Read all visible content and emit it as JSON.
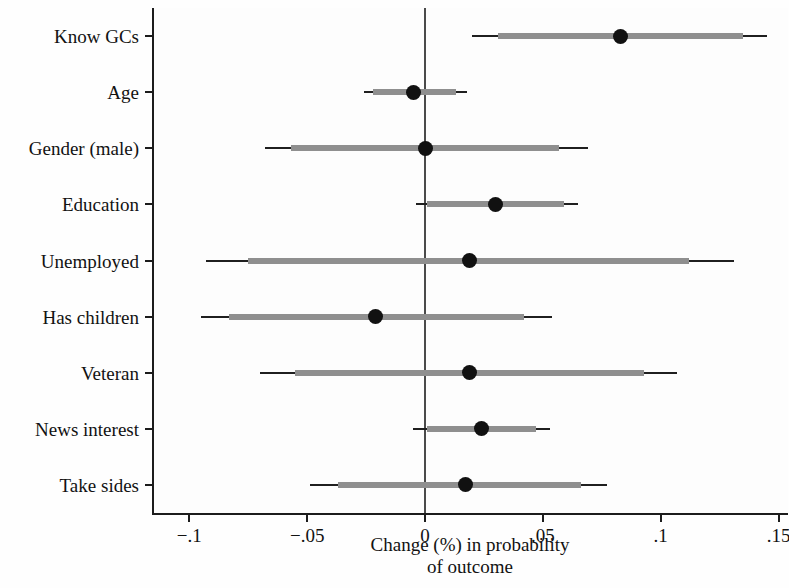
{
  "chart_data": {
    "type": "bar",
    "subtype": "coefficient-plot-horizontal",
    "title": "",
    "xlabel": "Change (%) in probability of outcome",
    "xlabel_lines": [
      "Change (%) in probability",
      "of outcome"
    ],
    "ylabel": "",
    "xlim": [
      -0.115,
      0.154
    ],
    "xticks": [
      -0.1,
      -0.05,
      0,
      0.05,
      0.1,
      0.15
    ],
    "xticklabels": [
      "−.1",
      "−.05",
      "0",
      ".05",
      ".1",
      ".15"
    ],
    "grid": false,
    "legend": null,
    "reference_line": 0,
    "categories": [
      "Know GCs",
      "Age",
      "Gender (male)",
      "Education",
      "Unemployed",
      "Has children",
      "Veteran",
      "News interest",
      "Take sides"
    ],
    "values": [
      0.083,
      -0.005,
      0.0,
      0.03,
      0.019,
      -0.021,
      0.019,
      0.024,
      0.017
    ],
    "series": [
      {
        "name": "Point estimate with 90% and 95% confidence intervals",
        "points": [
          {
            "category": "Know GCs",
            "estimate": 0.083,
            "ci_outer": [
              0.02,
              0.145
            ],
            "ci_inner": [
              0.031,
              0.135
            ]
          },
          {
            "category": "Age",
            "estimate": -0.005,
            "ci_outer": [
              -0.026,
              0.018
            ],
            "ci_inner": [
              -0.022,
              0.013
            ]
          },
          {
            "category": "Gender (male)",
            "estimate": 0.0,
            "ci_outer": [
              -0.068,
              0.069
            ],
            "ci_inner": [
              -0.057,
              0.057
            ]
          },
          {
            "category": "Education",
            "estimate": 0.03,
            "ci_outer": [
              -0.004,
              0.065
            ],
            "ci_inner": [
              0.001,
              0.059
            ]
          },
          {
            "category": "Unemployed",
            "estimate": 0.019,
            "ci_outer": [
              -0.093,
              0.131
            ],
            "ci_inner": [
              -0.075,
              0.112
            ]
          },
          {
            "category": "Has children",
            "estimate": -0.021,
            "ci_outer": [
              -0.095,
              0.054
            ],
            "ci_inner": [
              -0.083,
              0.042
            ]
          },
          {
            "category": "Veteran",
            "estimate": 0.019,
            "ci_outer": [
              -0.07,
              0.107
            ],
            "ci_inner": [
              -0.055,
              0.093
            ]
          },
          {
            "category": "News interest",
            "estimate": 0.024,
            "ci_outer": [
              -0.005,
              0.053
            ],
            "ci_inner": [
              0.001,
              0.047
            ]
          },
          {
            "category": "Take sides",
            "estimate": 0.017,
            "ci_outer": [
              -0.049,
              0.077
            ],
            "ci_inner": [
              -0.037,
              0.066
            ]
          }
        ]
      }
    ],
    "colors": {
      "point": "#111111",
      "ci_outer": "#1f1f1f",
      "ci_inner": "#8f8f8f",
      "axis": "#1c1c1c",
      "reference_line": "#4a4a4a",
      "background": "#fefefe"
    }
  }
}
